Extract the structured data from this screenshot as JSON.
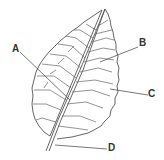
{
  "diagram": {
    "labels": [
      {
        "id": "A",
        "text": "A"
      },
      {
        "id": "B",
        "text": "B"
      },
      {
        "id": "C",
        "text": "C"
      },
      {
        "id": "D",
        "text": "D"
      }
    ],
    "colors": {
      "line": "#555555",
      "label": "#333333",
      "background": "#ffffff"
    }
  }
}
